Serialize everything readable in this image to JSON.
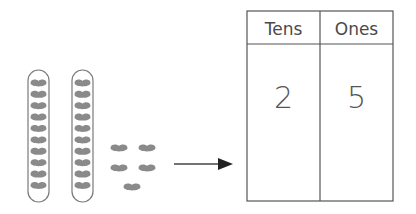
{
  "diagram": {
    "title": "",
    "tens_groups": 2,
    "beans_per_group": 10,
    "loose_beans": 5,
    "colors": {
      "bean": "#8a8a8a",
      "outline": "#7a7a7a",
      "table_line": "#555555"
    }
  },
  "table": {
    "headers": [
      "Tens",
      "Ones"
    ],
    "values": [
      "2",
      "5"
    ]
  }
}
